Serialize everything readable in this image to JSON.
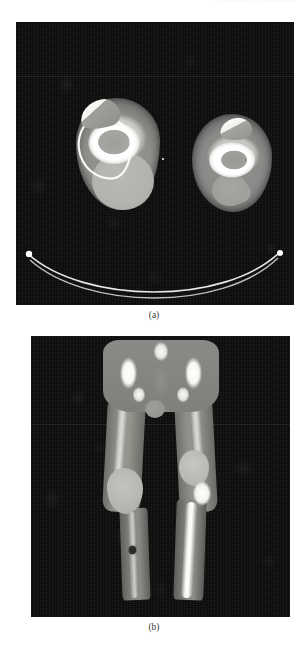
{
  "figure": {
    "header_ghost": "Case Reports in Orthopedics",
    "panels": [
      {
        "id": "a",
        "caption": "(a)",
        "modality": "CT",
        "plane": "axial",
        "description": "Axial CT image at the level of both knees showing bilateral femoral condyles with cortical bone, and large posterior soft-tissue masses; CT table mattress visible as a curved bright band below.",
        "features": [
          {
            "name": "left-knee-cross-section",
            "label": "Left knee"
          },
          {
            "name": "right-knee-cross-section",
            "label": "Right knee"
          },
          {
            "name": "left-posterior-mass",
            "label": "Posterior soft tissue mass"
          },
          {
            "name": "right-posterior-mass",
            "label": "Posterior soft tissue mass"
          },
          {
            "name": "ct-table-support",
            "label": "CT table support"
          }
        ]
      },
      {
        "id": "b",
        "caption": "(b)",
        "modality": "CT",
        "plane": "coronal",
        "description": "Coronal reformatted CT of the pelvis and both lower extremities showing the iliac wings, femoral heads, bilateral femora, bilateral knee soft tissue masses and the tibial shafts.",
        "features": [
          {
            "name": "pelvis",
            "label": "Pelvis"
          },
          {
            "name": "bladder",
            "label": "Bladder"
          },
          {
            "name": "left-thigh",
            "label": "Left thigh"
          },
          {
            "name": "right-thigh",
            "label": "Right thigh"
          },
          {
            "name": "left-knee-mass",
            "label": "Left knee mass"
          },
          {
            "name": "right-knee-mass",
            "label": "Right knee mass"
          },
          {
            "name": "left-lower-leg",
            "label": "Left lower leg"
          },
          {
            "name": "right-lower-leg",
            "label": "Right lower leg"
          }
        ]
      }
    ],
    "colors": {
      "page_background": "#ffffff",
      "image_background": "#0b0b0b",
      "bone_bright": "#ffffff",
      "soft_tissue": "#8f8f8c",
      "mass": "#b6b6b3",
      "caption_text": "#3a3a3a"
    }
  }
}
